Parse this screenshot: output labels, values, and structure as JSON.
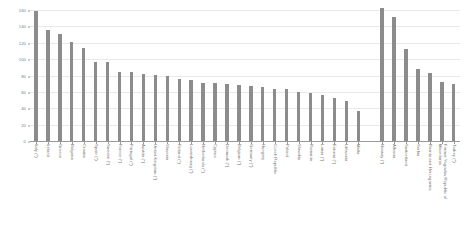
{
  "chart_data": {
    "type": "bar",
    "title": "",
    "subtitle": "",
    "xlabel": "",
    "ylabel": "",
    "ylim": [
      0,
      160
    ],
    "grid": true,
    "legend": "none",
    "bar_color": "#8c8c8c",
    "yticks": [
      0,
      20,
      40,
      60,
      80,
      100,
      120,
      140,
      160
    ],
    "ytick_labels": [
      "0",
      "20",
      "40",
      "60",
      "80",
      "100",
      "120",
      "140",
      "160"
    ],
    "categories": [
      "Italy (*)",
      "Ireland",
      "Greece",
      "Bulgaria",
      "Croatia",
      "Spain (*)",
      "Sweden (*)",
      "France (*)",
      "Portugal (*)",
      "Austria (*)",
      "United Kingdom (*)",
      "Slovenia",
      "Finland (*)",
      "Luxembourg (*)",
      "Netherlands (*)",
      "Cyprus",
      "Denmark (*)",
      "Belgium (*)",
      "Germany (*)",
      "Hungary",
      "Czech Republic",
      "Poland",
      "Slovakia",
      "Romania",
      "Latvia (*)",
      "Estonia (*)",
      "Lithuania",
      "Malta",
      "",
      "Norway (*)",
      "Albania",
      "Switzerland",
      "Serbia",
      "Bosnia and Herzegovina",
      "Former Yugoslav Republic of Macedonia",
      "Turkey (*)"
    ],
    "values": [
      159,
      135,
      131,
      121,
      113,
      97,
      96,
      84,
      84,
      82,
      81,
      80,
      76,
      75,
      71,
      71,
      70,
      69,
      67,
      66,
      64,
      63,
      60,
      59,
      56,
      53,
      49,
      37,
      null,
      163,
      152,
      112,
      88,
      83,
      72,
      70
    ]
  }
}
